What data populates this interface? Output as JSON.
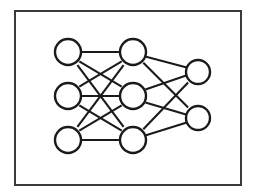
{
  "figure": {
    "background_color": "#ffffff",
    "canvas": {
      "width": 254,
      "height": 196
    }
  },
  "frame": {
    "name": "outer-border",
    "x": 14,
    "y": 10,
    "width": 228,
    "height": 176,
    "stroke_color": "#3a3a3a",
    "stroke_width": 2,
    "fill_color": "#ffffff"
  },
  "style": {
    "node_stroke_color": "#1a1a1a",
    "node_fill_color": "#ffffff",
    "node_stroke_width": 2.4,
    "edge_color": "#1a1a1a",
    "edge_width": 2.1
  },
  "chart_data": {
    "type": "diagram",
    "diagram_kind": "feedforward-neural-network",
    "layer_sizes": [
      3,
      3,
      2
    ],
    "layers": [
      {
        "id": "input",
        "label": "Input layer",
        "node_count": 3,
        "center_x": 68,
        "node_radius": 13,
        "nodes": [
          {
            "id": "i1",
            "cx": 68,
            "cy": 52,
            "r": 13
          },
          {
            "id": "i2",
            "cx": 68,
            "cy": 96,
            "r": 13
          },
          {
            "id": "i3",
            "cx": 68,
            "cy": 140,
            "r": 13
          }
        ]
      },
      {
        "id": "hidden",
        "label": "Hidden layer",
        "node_count": 3,
        "center_x": 133,
        "node_radius": 13,
        "nodes": [
          {
            "id": "h1",
            "cx": 133,
            "cy": 52,
            "r": 13
          },
          {
            "id": "h2",
            "cx": 133,
            "cy": 96,
            "r": 13
          },
          {
            "id": "h3",
            "cx": 133,
            "cy": 140,
            "r": 13
          }
        ]
      },
      {
        "id": "output",
        "label": "Output layer",
        "node_count": 2,
        "center_x": 198,
        "node_radius": 12,
        "nodes": [
          {
            "id": "o1",
            "cx": 198,
            "cy": 72,
            "r": 12
          },
          {
            "id": "o2",
            "cx": 198,
            "cy": 118,
            "r": 12
          }
        ]
      }
    ],
    "connections_fully_connected": true,
    "edges": [
      {
        "from": "i1",
        "to": "h1",
        "x1": 81,
        "y1": 52,
        "x2": 120,
        "y2": 52
      },
      {
        "from": "i1",
        "to": "h2",
        "x1": 79.3,
        "y1": 61.3,
        "x2": 121.7,
        "y2": 86.7
      },
      {
        "from": "i1",
        "to": "h3",
        "x1": 77.4,
        "y1": 65.1,
        "x2": 123.6,
        "y2": 126.9
      },
      {
        "from": "i2",
        "to": "h1",
        "x1": 79.3,
        "y1": 86.7,
        "x2": 121.7,
        "y2": 61.3
      },
      {
        "from": "i2",
        "to": "h2",
        "x1": 81,
        "y1": 96,
        "x2": 120,
        "y2": 96
      },
      {
        "from": "i2",
        "to": "h3",
        "x1": 79.3,
        "y1": 105.3,
        "x2": 121.7,
        "y2": 130.7
      },
      {
        "from": "i3",
        "to": "h1",
        "x1": 77.4,
        "y1": 126.9,
        "x2": 123.6,
        "y2": 65.1
      },
      {
        "from": "i3",
        "to": "h2",
        "x1": 79.3,
        "y1": 130.7,
        "x2": 121.7,
        "y2": 105.3
      },
      {
        "from": "i3",
        "to": "h3",
        "x1": 81,
        "y1": 140,
        "x2": 120,
        "y2": 140
      },
      {
        "from": "h1",
        "to": "o1",
        "x1": 145.2,
        "y1": 56.6,
        "x2": 186.8,
        "y2": 67.4
      },
      {
        "from": "h1",
        "to": "o2",
        "x1": 143.3,
        "y1": 62.8,
        "x2": 188.1,
        "y2": 107.6
      },
      {
        "from": "h2",
        "to": "o1",
        "x1": 145.4,
        "y1": 89.5,
        "x2": 186.9,
        "y2": 75.3
      },
      {
        "from": "h2",
        "to": "o2",
        "x1": 145.4,
        "y1": 102.5,
        "x2": 186.9,
        "y2": 114.7
      },
      {
        "from": "h3",
        "to": "o1",
        "x1": 143.3,
        "y1": 129.2,
        "x2": 188.1,
        "y2": 82.4
      },
      {
        "from": "h3",
        "to": "o2",
        "x1": 145.2,
        "y1": 135.4,
        "x2": 186.8,
        "y2": 122.6
      }
    ],
    "xlabel": "",
    "ylabel": "",
    "legend": [],
    "annotations": []
  }
}
